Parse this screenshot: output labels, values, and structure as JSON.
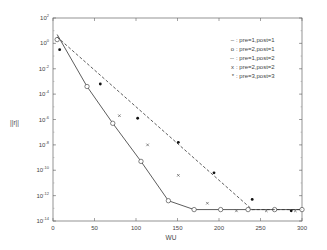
{
  "chart_data": {
    "type": "line",
    "title": "",
    "xlabel": "WU",
    "ylabel": "||r||",
    "xlim": [
      0,
      300
    ],
    "ylim_log10": [
      -14,
      2
    ],
    "yscale": "log",
    "grid": false,
    "legend_position": "upper right",
    "x_ticks": [
      0,
      50,
      100,
      150,
      200,
      250,
      300
    ],
    "y_ticks": [
      {
        "exp": "2"
      },
      {
        "exp": "0"
      },
      {
        "exp": "-2"
      },
      {
        "exp": "-4"
      },
      {
        "exp": "-6"
      },
      {
        "exp": "-8"
      },
      {
        "exp": "-10"
      },
      {
        "exp": "-12"
      },
      {
        "exp": "-14"
      }
    ],
    "legend": [
      {
        "symbol": "–",
        "label": ": pre=1,post=1"
      },
      {
        "symbol": "o",
        "label": ": pre=2,post=1"
      },
      {
        "symbol": "--",
        "label": ": pre=1,post=2"
      },
      {
        "symbol": "x",
        "label": ": pre=2,post=2"
      },
      {
        "symbol": "*",
        "label": ": pre=3,post=3"
      }
    ],
    "series": [
      {
        "name": "pre=1,post=1",
        "style": "solid",
        "x": [
          5,
          41,
          72,
          106,
          139,
          170,
          200,
          250,
          300
        ],
        "log10_y": [
          0.7,
          -3.4,
          -6.3,
          -9.3,
          -12.4,
          -13.1,
          -13.1,
          -13.1,
          -13.1
        ]
      },
      {
        "name": "pre=2,post=1",
        "style": "circle",
        "x": [
          5,
          41,
          72,
          106,
          139,
          170,
          202,
          235,
          267,
          300
        ],
        "log10_y": [
          0.3,
          -3.4,
          -6.3,
          -9.3,
          -12.4,
          -13.1,
          -13.1,
          -13.1,
          -13.1,
          -13.1
        ]
      },
      {
        "name": "pre=1,post=2",
        "style": "dashed",
        "x": [
          5,
          240,
          300
        ],
        "log10_y": [
          0.5,
          -13.1,
          -13.1
        ]
      },
      {
        "name": "pre=2,post=2",
        "style": "x",
        "x": [
          80,
          114,
          151,
          186,
          221,
          257,
          292
        ],
        "log10_y": [
          -5.7,
          -8.0,
          -10.4,
          -12.6,
          -13.2,
          -13.2,
          -13.2
        ]
      },
      {
        "name": "pre=3,post=3",
        "style": "star",
        "x": [
          8,
          57,
          102,
          151,
          194,
          240,
          287
        ],
        "log10_y": [
          -0.5,
          -3.2,
          -5.9,
          -7.8,
          -10.2,
          -12.3,
          -13.2
        ]
      }
    ]
  }
}
